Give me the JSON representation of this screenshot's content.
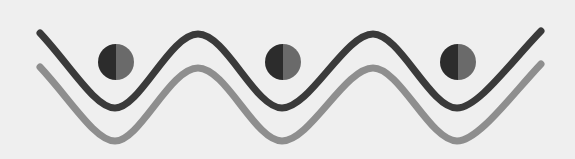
{
  "graphic": {
    "description": "Decorative logo-like graphic: two parallel sine waves with three half-shaded circles",
    "background_color": "#efefef",
    "waves": [
      {
        "name": "dark-wave",
        "color": "#3a3a3a",
        "stroke_width": 7,
        "path": "M40,33 C70,65 95,108 115,108 C140,108 170,34 198,34 C226,34 255,108 282,108 C310,108 345,34 373,34 C400,34 430,108 457,108 C478,108 510,63 541,31"
      },
      {
        "name": "light-wave",
        "color": "#8e8e8e",
        "stroke_width": 7,
        "path": "M40,67 C70,99 95,141 115,141 C140,141 170,68 198,68 C226,68 255,141 282,141 C310,141 345,68 373,68 C400,68 430,141 457,141 C478,141 510,97 541,64"
      }
    ],
    "circles": [
      {
        "cx": 116,
        "cy": 62,
        "r": 18,
        "left_color": "#2c2c2c",
        "right_color": "#6a6a6a"
      },
      {
        "cx": 283,
        "cy": 62,
        "r": 18,
        "left_color": "#2c2c2c",
        "right_color": "#6a6a6a"
      },
      {
        "cx": 458,
        "cy": 62,
        "r": 18,
        "left_color": "#2c2c2c",
        "right_color": "#6a6a6a"
      }
    ]
  }
}
